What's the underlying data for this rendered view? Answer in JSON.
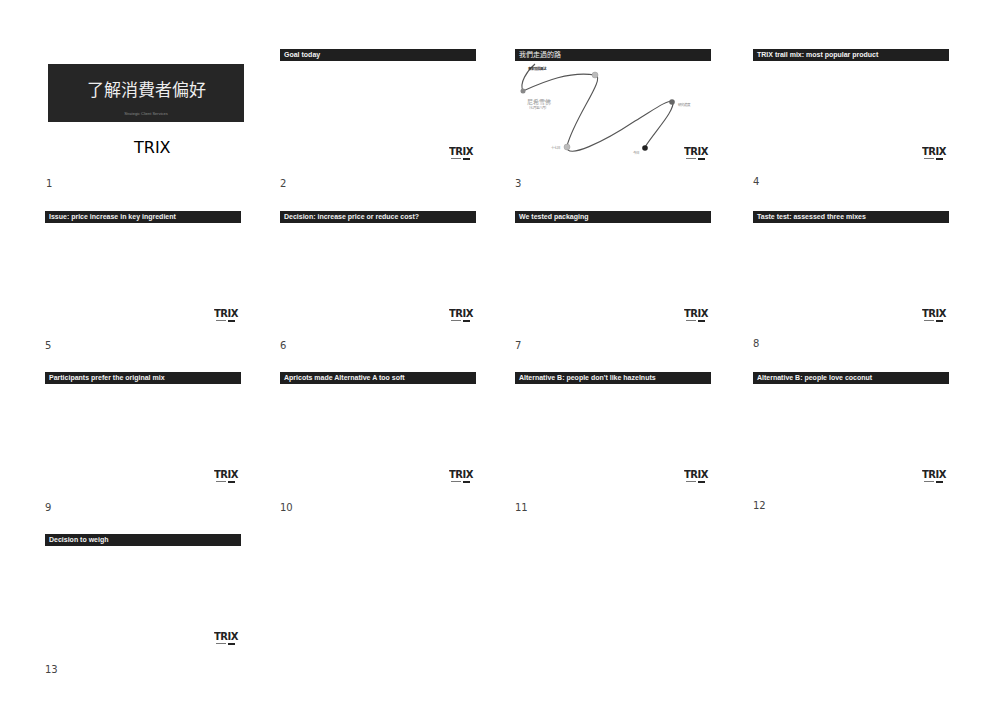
{
  "view": "slide-sorter",
  "slides": [
    {
      "number": "1",
      "type": "cover",
      "title": "了解消費者偏好",
      "subtitle": "Strategic Client Services",
      "logo": "TRIX"
    },
    {
      "number": "2",
      "title": "Goal today",
      "logo": "TRIX"
    },
    {
      "number": "3",
      "title": "我們走過的路",
      "logo": "TRIX",
      "map_labels": {
        "start": "專案發展概述",
        "node1": "尼希雪佛",
        "node1_sub": "（七月至八月）",
        "node2": "十七日",
        "node3": "研究進度",
        "end": "今日"
      }
    },
    {
      "number": "4",
      "title": "TRIX trail mix: most popular product",
      "logo": "TRIX"
    },
    {
      "number": "5",
      "title": "Issue: price increase in key ingredient",
      "logo": "TRIX"
    },
    {
      "number": "6",
      "title": "Decision: increase price or reduce cost?",
      "logo": "TRIX"
    },
    {
      "number": "7",
      "title": "We tested packaging",
      "logo": "TRIX"
    },
    {
      "number": "8",
      "title": "Taste test: assessed three mixes",
      "logo": "TRIX"
    },
    {
      "number": "9",
      "title": "Participants prefer the original mix",
      "logo": "TRIX"
    },
    {
      "number": "10",
      "title": "Apricots made Alternative A too soft",
      "logo": "TRIX"
    },
    {
      "number": "11",
      "title": "Alternative B: people don't like hazelnuts",
      "logo": "TRIX"
    },
    {
      "number": "12",
      "title": "Alternative B: people love coconut",
      "logo": "TRIX"
    },
    {
      "number": "13",
      "title": "Decision to weigh",
      "logo": "TRIX"
    }
  ],
  "colors": {
    "title_bar": "#1f1f1f",
    "title_text": "#f2f2f2",
    "background": "#ffffff",
    "cover_box": "#262626"
  }
}
